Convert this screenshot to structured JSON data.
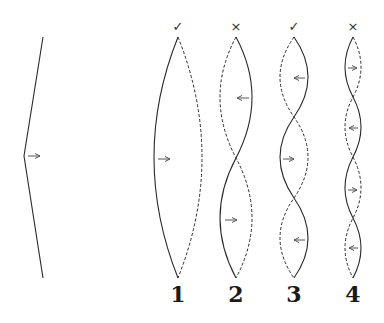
{
  "diagram": {
    "type": "standing-wave-modes",
    "plucked_string": {
      "arrow_direction": "right"
    },
    "modes": [
      {
        "label": "1",
        "mark": "✓",
        "mark_meaning": "check",
        "x": 178,
        "loops": 1,
        "arrows": [
          "right"
        ]
      },
      {
        "label": "2",
        "mark": "×",
        "mark_meaning": "cross",
        "x": 236,
        "loops": 2,
        "arrows": [
          "left",
          "right"
        ]
      },
      {
        "label": "3",
        "mark": "✓",
        "mark_meaning": "check",
        "x": 294,
        "loops": 3,
        "arrows": [
          "left",
          "right",
          "left"
        ]
      },
      {
        "label": "4",
        "mark": "×",
        "mark_meaning": "cross",
        "x": 353,
        "loops": 4,
        "arrows": [
          "right",
          "left",
          "right",
          "left"
        ]
      }
    ],
    "colors": {
      "line": "#2a2a2a",
      "arrow": "#555555",
      "background": "#ffffff"
    }
  }
}
